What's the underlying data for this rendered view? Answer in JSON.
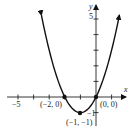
{
  "chart_data": {
    "type": "line",
    "title": "",
    "function": "y = x^2 + 2x",
    "xlabel": "x",
    "ylabel": "y",
    "xlim": [
      -6,
      1.8
    ],
    "ylim": [
      -1.7,
      5.8
    ],
    "x_tick_labels": [
      {
        "value": -5,
        "label": "-5"
      }
    ],
    "y_tick_labels": [
      {
        "value": 5,
        "label": "5"
      },
      {
        "value": -1,
        "label": "-1"
      }
    ],
    "x_ticks": [
      -5,
      -4,
      -3,
      -2,
      -1,
      1
    ],
    "y_ticks": [
      -1,
      1,
      2,
      3,
      4,
      5
    ],
    "grid": false,
    "series": [
      {
        "name": "parabola",
        "x": [
          -3.5,
          -3,
          -2.5,
          -2,
          -1.5,
          -1,
          -0.5,
          0,
          0.5,
          1,
          1.5
        ],
        "y": [
          5.25,
          3,
          1.25,
          0,
          -0.75,
          -1,
          -0.75,
          0,
          1.25,
          3,
          5.25
        ],
        "color": "#111111",
        "arrows": "both-ends"
      }
    ],
    "points": [
      {
        "x": -2,
        "y": 0,
        "label": "(−2, 0)"
      },
      {
        "x": 0,
        "y": 0,
        "label": "(0, 0)"
      },
      {
        "x": -1,
        "y": -1,
        "label": "(−1, −1)"
      }
    ]
  },
  "labels": {
    "x_axis": "x",
    "y_axis": "y",
    "tick_neg5": "−5",
    "tick_5": "5",
    "tick_neg1": "−1",
    "pt_left": "(−2, 0)",
    "pt_origin": "(0, 0)",
    "pt_vertex": "(−1, −1)"
  }
}
